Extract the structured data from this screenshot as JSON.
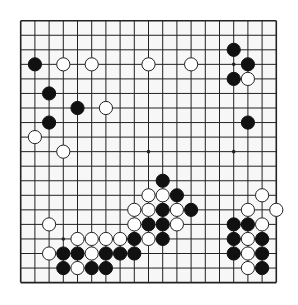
{
  "board": {
    "size": 19,
    "origin_x": 20.7,
    "origin_y": 20.7,
    "spacing_x": 14.2,
    "spacing_y": 14.55,
    "background": "#f7f7f7",
    "line_color": "#222222",
    "star_points": [
      [
        3,
        3
      ],
      [
        9,
        3
      ],
      [
        15,
        3
      ],
      [
        3,
        9
      ],
      [
        9,
        9
      ],
      [
        15,
        9
      ],
      [
        3,
        15
      ],
      [
        9,
        15
      ],
      [
        15,
        15
      ]
    ],
    "black_stones": [
      [
        1,
        3
      ],
      [
        2,
        5
      ],
      [
        4,
        6
      ],
      [
        2,
        7
      ],
      [
        15,
        2
      ],
      [
        16,
        3
      ],
      [
        15,
        4
      ],
      [
        16,
        7
      ],
      [
        10,
        11
      ],
      [
        11,
        12
      ],
      [
        10,
        13
      ],
      [
        12,
        13
      ],
      [
        9,
        14
      ],
      [
        10,
        14
      ],
      [
        8,
        15
      ],
      [
        10,
        15
      ],
      [
        3,
        16
      ],
      [
        4,
        16
      ],
      [
        6,
        16
      ],
      [
        7,
        16
      ],
      [
        8,
        16
      ],
      [
        3,
        17
      ],
      [
        5,
        17
      ],
      [
        6,
        17
      ],
      [
        15,
        14
      ],
      [
        16,
        14
      ],
      [
        15,
        15
      ],
      [
        17,
        15
      ],
      [
        15,
        16
      ],
      [
        17,
        16
      ],
      [
        17,
        17
      ]
    ],
    "white_stones": [
      [
        3,
        3
      ],
      [
        5,
        3
      ],
      [
        9,
        3
      ],
      [
        12,
        3
      ],
      [
        6,
        6
      ],
      [
        1,
        8
      ],
      [
        3,
        9
      ],
      [
        16,
        4
      ],
      [
        9,
        12
      ],
      [
        10,
        12
      ],
      [
        8,
        13
      ],
      [
        9,
        13
      ],
      [
        11,
        13
      ],
      [
        8,
        14
      ],
      [
        11,
        14
      ],
      [
        9,
        15
      ],
      [
        2,
        14
      ],
      [
        4,
        15
      ],
      [
        5,
        15
      ],
      [
        6,
        15
      ],
      [
        7,
        15
      ],
      [
        2,
        16
      ],
      [
        5,
        16
      ],
      [
        4,
        17
      ],
      [
        17,
        12
      ],
      [
        16,
        13
      ],
      [
        18,
        13
      ],
      [
        17,
        14
      ],
      [
        16,
        15
      ],
      [
        16,
        16
      ],
      [
        16,
        17
      ]
    ]
  }
}
